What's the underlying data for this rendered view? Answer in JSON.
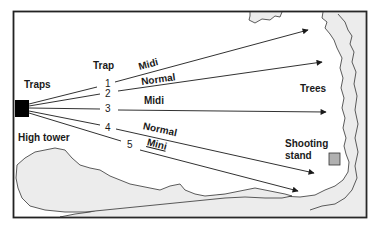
{
  "labels": {
    "traps": "Traps",
    "trap_header": "Trap",
    "high_tower": "High tower",
    "trees": "Trees",
    "shooting_stand_line1": "Shooting",
    "shooting_stand_line2": "stand"
  },
  "traps": [
    {
      "number": "1",
      "type": "Midi"
    },
    {
      "number": "2",
      "type": "Normal"
    },
    {
      "number": "3",
      "type": "Midi"
    },
    {
      "number": "4",
      "type": "Normal"
    },
    {
      "number": "5",
      "type": "Mini"
    }
  ],
  "colors": {
    "line": "#1a1a1a",
    "trees_fill": "#ececec",
    "stand_fill": "#b0b0b0",
    "trap_block": "#000000"
  }
}
